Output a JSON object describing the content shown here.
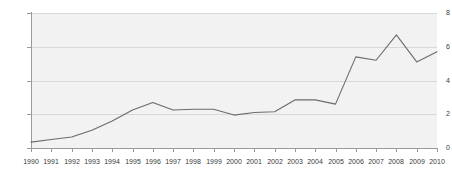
{
  "chart_data": {
    "type": "line",
    "title": "",
    "subtitle": "",
    "xlabel": "",
    "ylabel": "",
    "categories": [
      "1990",
      "1991",
      "1992",
      "1993",
      "1994",
      "1995",
      "1996",
      "1997",
      "1998",
      "1999",
      "2000",
      "2001",
      "2002",
      "2003",
      "2004",
      "2005",
      "2006",
      "2007",
      "2008",
      "2009",
      "2010"
    ],
    "x": [
      1990,
      1991,
      1992,
      1993,
      1994,
      1995,
      1996,
      1997,
      1998,
      1999,
      2000,
      2001,
      2002,
      2003,
      2004,
      2005,
      2006,
      2007,
      2008,
      2009,
      2010
    ],
    "values": [
      0.35,
      0.5,
      0.65,
      1.05,
      1.6,
      2.25,
      2.7,
      2.25,
      2.3,
      2.3,
      1.95,
      2.1,
      2.15,
      2.85,
      2.85,
      2.6,
      5.4,
      5.2,
      6.7,
      5.1,
      5.7
    ],
    "series": [
      {
        "name": "",
        "values": [
          0.35,
          0.5,
          0.65,
          1.05,
          1.6,
          2.25,
          2.7,
          2.25,
          2.3,
          2.3,
          1.95,
          2.1,
          2.15,
          2.85,
          2.85,
          2.6,
          5.4,
          5.2,
          6.7,
          5.1,
          5.7
        ]
      }
    ],
    "ylim": [
      0,
      8
    ],
    "yticks": [
      0,
      2,
      4,
      6,
      8
    ],
    "ytick_labels": [
      "0",
      "2",
      "4",
      "6",
      "8"
    ],
    "xlim": [
      1990,
      2010
    ],
    "grid": true,
    "grid_axis": "y",
    "legend": false,
    "legend_position": "none",
    "annotations": [],
    "colors": {
      "line": "#6b6b6b",
      "plot_background": "#f2f2f2",
      "page_background": "#ffffff",
      "gridline": "#d8d8d8",
      "axis": "#9a9a9a",
      "tick_text": "#3a3a3a"
    }
  }
}
